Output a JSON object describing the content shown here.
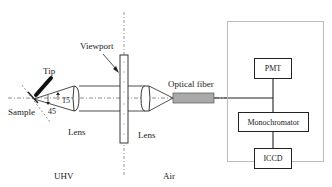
{
  "figure": {
    "labels": {
      "viewport": "Viewport",
      "tip": "Tip",
      "sample": "Sample",
      "angle_15": "15",
      "angle_45": "45",
      "lens_left": "Lens",
      "lens_right": "Lens",
      "optical_fiber": "Optical fiber",
      "uhv": "UHV",
      "air": "Air"
    },
    "boxes": {
      "pmt": "PMT",
      "monochromator": "Monochromator",
      "iccd": "ICCD"
    },
    "colors": {
      "line": "#222222",
      "fiber_fill": "#a9a9a9",
      "outer_box": "#bdbdbd"
    }
  }
}
